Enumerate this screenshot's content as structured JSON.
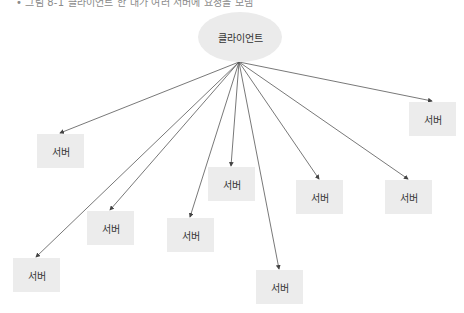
{
  "caption": "• 그림 8-1 클라이언트 한 대가 여러 서버에 요청을 보냄",
  "client": {
    "label": "클라이언트",
    "cx": 240,
    "cy": 37,
    "anchor": [
      239,
      62
    ]
  },
  "colors": {
    "node_fill": "#ececec",
    "edge": "#555555",
    "text": "#333333"
  },
  "servers": [
    {
      "label": "서버",
      "x": 409,
      "y": 102
    },
    {
      "label": "서버",
      "x": 37,
      "y": 134
    },
    {
      "label": "서버",
      "x": 208,
      "y": 167
    },
    {
      "label": "서버",
      "x": 296,
      "y": 180
    },
    {
      "label": "서버",
      "x": 385,
      "y": 180
    },
    {
      "label": "서버",
      "x": 87,
      "y": 211
    },
    {
      "label": "서버",
      "x": 167,
      "y": 218
    },
    {
      "label": "서버",
      "x": 13,
      "y": 258
    },
    {
      "label": "서버",
      "x": 256,
      "y": 270
    }
  ]
}
